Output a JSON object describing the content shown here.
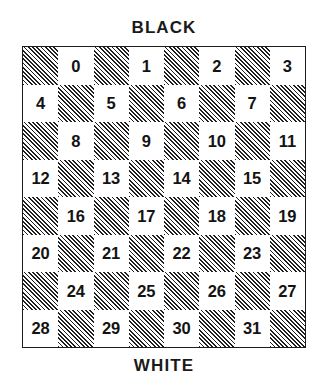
{
  "figure": {
    "title_top": "BLACK",
    "title_bottom": "WHITE",
    "colors": {
      "background": "#ffffff",
      "ink": "#1a1a1a",
      "hatch_line": "#1f1f1f",
      "light_square": "#ffffff",
      "board_border": "#1c1c1c"
    }
  },
  "chart_data": {
    "type": "table",
    "subtitle": "",
    "xlabel": "",
    "ylabel": "",
    "annotations": [
      "BLACK",
      "WHITE"
    ],
    "legend": [],
    "grid": true,
    "rows": 8,
    "columns": 8,
    "square_styles": [
      "hatched",
      "light"
    ],
    "numbered_square_style": "light",
    "number_range": [
      0,
      31
    ],
    "board": [
      [
        {
          "style": "hatched",
          "label": ""
        },
        {
          "style": "light",
          "label": "0"
        },
        {
          "style": "hatched",
          "label": ""
        },
        {
          "style": "light",
          "label": "1"
        },
        {
          "style": "hatched",
          "label": ""
        },
        {
          "style": "light",
          "label": "2"
        },
        {
          "style": "hatched",
          "label": ""
        },
        {
          "style": "light",
          "label": "3"
        }
      ],
      [
        {
          "style": "light",
          "label": "4"
        },
        {
          "style": "hatched",
          "label": ""
        },
        {
          "style": "light",
          "label": "5"
        },
        {
          "style": "hatched",
          "label": ""
        },
        {
          "style": "light",
          "label": "6"
        },
        {
          "style": "hatched",
          "label": ""
        },
        {
          "style": "light",
          "label": "7"
        },
        {
          "style": "hatched",
          "label": ""
        }
      ],
      [
        {
          "style": "hatched",
          "label": ""
        },
        {
          "style": "light",
          "label": "8"
        },
        {
          "style": "hatched",
          "label": ""
        },
        {
          "style": "light",
          "label": "9"
        },
        {
          "style": "hatched",
          "label": ""
        },
        {
          "style": "light",
          "label": "10"
        },
        {
          "style": "hatched",
          "label": ""
        },
        {
          "style": "light",
          "label": "11"
        }
      ],
      [
        {
          "style": "light",
          "label": "12"
        },
        {
          "style": "hatched",
          "label": ""
        },
        {
          "style": "light",
          "label": "13"
        },
        {
          "style": "hatched",
          "label": ""
        },
        {
          "style": "light",
          "label": "14"
        },
        {
          "style": "hatched",
          "label": ""
        },
        {
          "style": "light",
          "label": "15"
        },
        {
          "style": "hatched",
          "label": ""
        }
      ],
      [
        {
          "style": "hatched",
          "label": ""
        },
        {
          "style": "light",
          "label": "16"
        },
        {
          "style": "hatched",
          "label": ""
        },
        {
          "style": "light",
          "label": "17"
        },
        {
          "style": "hatched",
          "label": ""
        },
        {
          "style": "light",
          "label": "18"
        },
        {
          "style": "hatched",
          "label": ""
        },
        {
          "style": "light",
          "label": "19"
        }
      ],
      [
        {
          "style": "light",
          "label": "20"
        },
        {
          "style": "hatched",
          "label": ""
        },
        {
          "style": "light",
          "label": "21"
        },
        {
          "style": "hatched",
          "label": ""
        },
        {
          "style": "light",
          "label": "22"
        },
        {
          "style": "hatched",
          "label": ""
        },
        {
          "style": "light",
          "label": "23"
        },
        {
          "style": "hatched",
          "label": ""
        }
      ],
      [
        {
          "style": "hatched",
          "label": ""
        },
        {
          "style": "light",
          "label": "24"
        },
        {
          "style": "hatched",
          "label": ""
        },
        {
          "style": "light",
          "label": "25"
        },
        {
          "style": "hatched",
          "label": ""
        },
        {
          "style": "light",
          "label": "26"
        },
        {
          "style": "hatched",
          "label": ""
        },
        {
          "style": "light",
          "label": "27"
        }
      ],
      [
        {
          "style": "light",
          "label": "28"
        },
        {
          "style": "hatched",
          "label": ""
        },
        {
          "style": "light",
          "label": "29"
        },
        {
          "style": "hatched",
          "label": ""
        },
        {
          "style": "light",
          "label": "30"
        },
        {
          "style": "hatched",
          "label": ""
        },
        {
          "style": "light",
          "label": "31"
        },
        {
          "style": "hatched",
          "label": ""
        }
      ]
    ]
  }
}
